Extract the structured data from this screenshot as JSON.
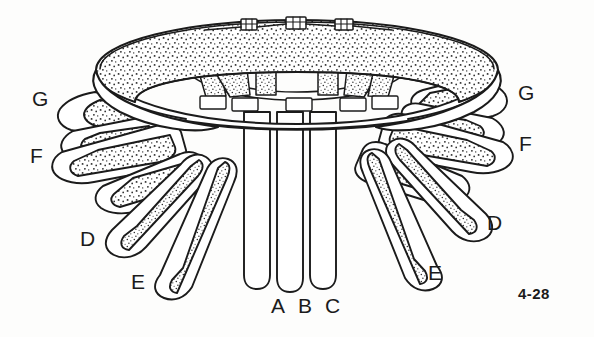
{
  "figure": {
    "number": "4-28",
    "kind": "line-drawing",
    "background_color": "#fdfdfc",
    "ink_color": "#1b1b1b",
    "stipple_color": "#2a2a2a",
    "width": 594,
    "height": 337
  },
  "labels": [
    {
      "id": "g-left",
      "text": "G",
      "x": 32,
      "y": 88
    },
    {
      "id": "f-left",
      "text": "F",
      "x": 30,
      "y": 145
    },
    {
      "id": "d-left",
      "text": "D",
      "x": 80,
      "y": 228
    },
    {
      "id": "e-left",
      "text": "E",
      "x": 131,
      "y": 271
    },
    {
      "id": "a-bottom",
      "text": "A",
      "x": 271,
      "y": 295
    },
    {
      "id": "b-bottom",
      "text": "B",
      "x": 298,
      "y": 295
    },
    {
      "id": "c-bottom",
      "text": "C",
      "x": 325,
      "y": 295
    },
    {
      "id": "e-right",
      "text": "E",
      "x": 428,
      "y": 262
    },
    {
      "id": "d-right",
      "text": "D",
      "x": 487,
      "y": 212
    },
    {
      "id": "f-right",
      "text": "F",
      "x": 519,
      "y": 133
    },
    {
      "id": "g-right",
      "text": "G",
      "x": 518,
      "y": 82
    }
  ],
  "figure_number_position": {
    "x": 518,
    "y": 286
  },
  "structures": {
    "central_columns": [
      "A",
      "B",
      "C"
    ],
    "arm_label_pairs": [
      "D",
      "E",
      "F",
      "G"
    ],
    "crown_blocks": 3
  }
}
